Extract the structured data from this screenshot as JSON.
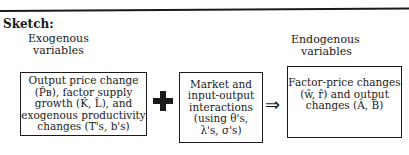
{
  "sketch": {
    "heading": "Sketch:",
    "exogenous_label": {
      "line1": "Exogenous",
      "line2": "variables"
    },
    "endogenous_label": {
      "line1": "Endogenous",
      "line2": "variables"
    },
    "box_exogenous": {
      "lines": [
        "Output price change",
        "(P̂ʙ), factor supply",
        "growth (K̂, L̂), and",
        "exogenous productivity",
        "changes (T's, b's)"
      ]
    },
    "operator_plus": "+",
    "box_interactions": {
      "lines": [
        "Market and",
        "input-output",
        "interactions",
        "(using θ's,",
        "λ's, σ's)"
      ]
    },
    "operator_implies": "⇒",
    "box_endogenous": {
      "lines": [
        "Factor-price changes",
        "(ŵ, r̂) and output",
        "changes (Â, B̂)"
      ]
    }
  }
}
